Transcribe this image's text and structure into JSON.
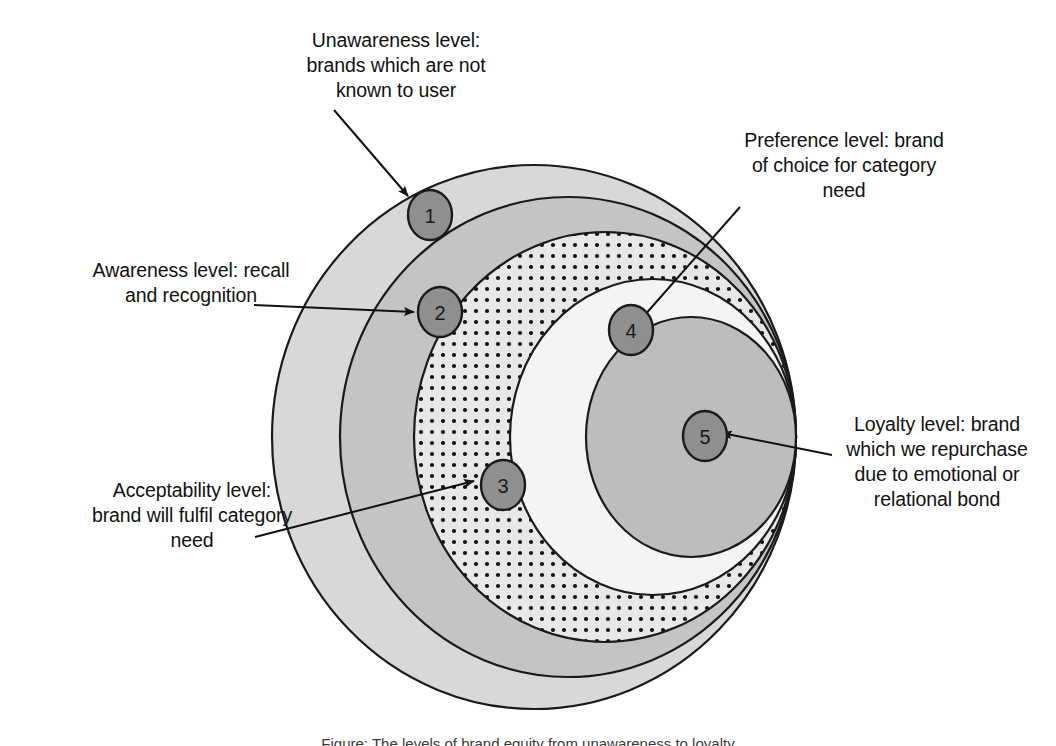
{
  "figure": {
    "title": "Levels of brand equity",
    "caption": "Figure: The levels of brand equity from unawareness to loyalty"
  },
  "colors": {
    "unawareness_fill": "#d8d8d8",
    "awareness_fill": "#c4c4c4",
    "acceptability_fill": "#e6e6e6",
    "acceptability_dots": "#111111",
    "preference_fill": "#f4f4f4",
    "loyalty_fill": "#bdbdbd",
    "marker_fill": "#8f8f8f",
    "stroke": "#1a1a1a",
    "text": "#111111",
    "background": "#ffffff"
  },
  "levels": [
    {
      "number": "1",
      "name": "unawareness",
      "label": "Unawareness level:\nbrands which are not\nknown to user"
    },
    {
      "number": "2",
      "name": "awareness",
      "label": "Awareness level: recall\nand recognition"
    },
    {
      "number": "3",
      "name": "acceptability",
      "label": "Acceptability level:\nbrand will fulfil category\nneed"
    },
    {
      "number": "4",
      "name": "preference",
      "label": "Preference level: brand\nof choice for category\nneed"
    },
    {
      "number": "5",
      "name": "loyalty",
      "label": "Loyalty level: brand\nwhich we repurchase\ndue to emotional or\nrelational bond"
    }
  ],
  "markers": {
    "m1": "1",
    "m2": "2",
    "m3": "3",
    "m4": "4",
    "m5": "5"
  }
}
